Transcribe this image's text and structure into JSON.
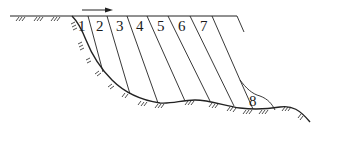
{
  "diagram": {
    "type": "slope-stability-slices",
    "direction_arrow": {
      "icon": "arrow-right-icon",
      "meaning": "sliding direction"
    },
    "slices": [
      {
        "id": "1",
        "label": "1"
      },
      {
        "id": "2",
        "label": "2"
      },
      {
        "id": "3",
        "label": "3"
      },
      {
        "id": "4",
        "label": "4"
      },
      {
        "id": "5",
        "label": "5"
      },
      {
        "id": "6",
        "label": "6"
      },
      {
        "id": "7",
        "label": "7"
      },
      {
        "id": "8",
        "label": "8"
      }
    ],
    "colors": {
      "line": "#222222",
      "background": "#ffffff"
    }
  }
}
